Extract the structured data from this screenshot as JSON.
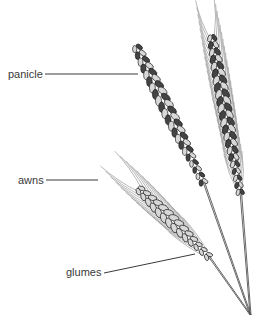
{
  "diagram": {
    "labels": [
      {
        "id": "panicle",
        "text": "panicle"
      },
      {
        "id": "awns",
        "text": "awns"
      },
      {
        "id": "glumes",
        "text": "glumes"
      }
    ]
  }
}
